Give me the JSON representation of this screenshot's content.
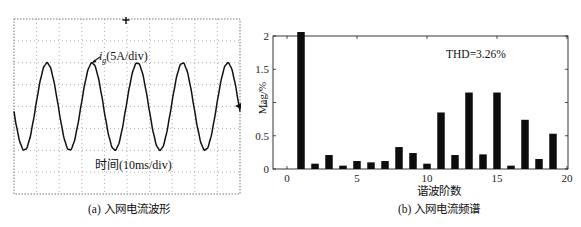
{
  "panel_a": {
    "caption": "(a) 入网电流波形",
    "signal_label": "i",
    "signal_subscript": "g",
    "signal_scale": "(5A/div)",
    "time_label": "时间(10ms/div)"
  },
  "panel_b": {
    "caption": "(b) 入网电流频谱",
    "xlabel": "谐波阶数",
    "ylabel": "Mag/%",
    "annotation": "THD=3.26%"
  },
  "chart_data": [
    {
      "type": "line",
      "title": "(a) 入网电流波形",
      "xlabel": "时间(10ms/div)",
      "ylabel": "i_g(5A/div)",
      "grid": true,
      "grid_divisions": {
        "x": 10,
        "y": 8
      },
      "series": [
        {
          "name": "i_g",
          "shape": "sinusoid",
          "cycles_visible": 5,
          "peak_divisions": 3.4,
          "approx_peak_A": 17
        }
      ]
    },
    {
      "type": "bar",
      "title": "(b) 入网电流频谱",
      "xlabel": "谐波阶数",
      "ylabel": "Mag/%",
      "annotation": "THD=3.26%",
      "xlim": [
        -0.5,
        20
      ],
      "ylim": [
        0,
        2
      ],
      "xticks": [
        0,
        5,
        10,
        15,
        20
      ],
      "yticks": [
        0,
        0.5,
        1,
        1.5,
        2
      ],
      "ytick_labels": [
        "0",
        "0.5",
        "1",
        "1.5",
        "2"
      ],
      "grid": false,
      "categories": [
        1,
        2,
        3,
        4,
        5,
        6,
        7,
        8,
        9,
        10,
        11,
        12,
        13,
        14,
        15,
        16,
        17,
        18,
        19
      ],
      "values": [
        2.06,
        0.08,
        0.21,
        0.05,
        0.12,
        0.1,
        0.12,
        0.33,
        0.24,
        0.08,
        0.85,
        0.21,
        1.15,
        0.22,
        1.15,
        0.05,
        0.74,
        0.15,
        0.53
      ]
    }
  ]
}
